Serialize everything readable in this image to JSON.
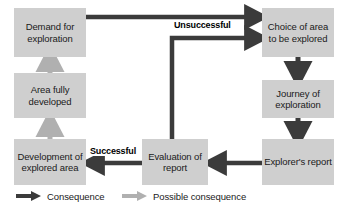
{
  "diagram": {
    "colors": {
      "node_fill": "#cfcfcf",
      "consequence_arrow": "#3b3b3b",
      "possible_consequence_arrow": "#b0b0b0",
      "text": "#1a1a1a",
      "background": "#ffffff"
    },
    "nodes": [
      {
        "id": "demand",
        "label": "Demand for exploration"
      },
      {
        "id": "choice",
        "label": "Choice of area to be explored"
      },
      {
        "id": "journey",
        "label": "Journey of exploration"
      },
      {
        "id": "explorer_report",
        "label": "Explorer's report"
      },
      {
        "id": "evaluation",
        "label": "Evaluation of report"
      },
      {
        "id": "development",
        "label": "Development of explored area"
      },
      {
        "id": "area_developed",
        "label": "Area fully developed"
      }
    ],
    "edge_labels": [
      {
        "id": "unsuccessful",
        "text": "Unsuccessful"
      },
      {
        "id": "successful",
        "text": "Successful"
      }
    ],
    "edges": [
      {
        "from": "demand",
        "to": "choice",
        "type": "consequence"
      },
      {
        "from": "choice",
        "to": "journey",
        "type": "consequence"
      },
      {
        "from": "journey",
        "to": "explorer_report",
        "type": "consequence"
      },
      {
        "from": "explorer_report",
        "to": "evaluation",
        "type": "consequence"
      },
      {
        "from": "evaluation",
        "to": "development",
        "type": "consequence",
        "label": "Successful"
      },
      {
        "from": "evaluation",
        "to": "choice",
        "type": "consequence",
        "label": "Unsuccessful"
      },
      {
        "from": "development",
        "to": "area_developed",
        "type": "possible_consequence"
      },
      {
        "from": "area_developed",
        "to": "demand",
        "type": "possible_consequence"
      }
    ]
  },
  "legend": {
    "items": [
      {
        "id": "consequence",
        "label": "Consequence",
        "arrow": "dark-arrow-icon"
      },
      {
        "id": "possible-consequence",
        "label": "Possible consequence",
        "arrow": "light-arrow-icon"
      }
    ]
  }
}
